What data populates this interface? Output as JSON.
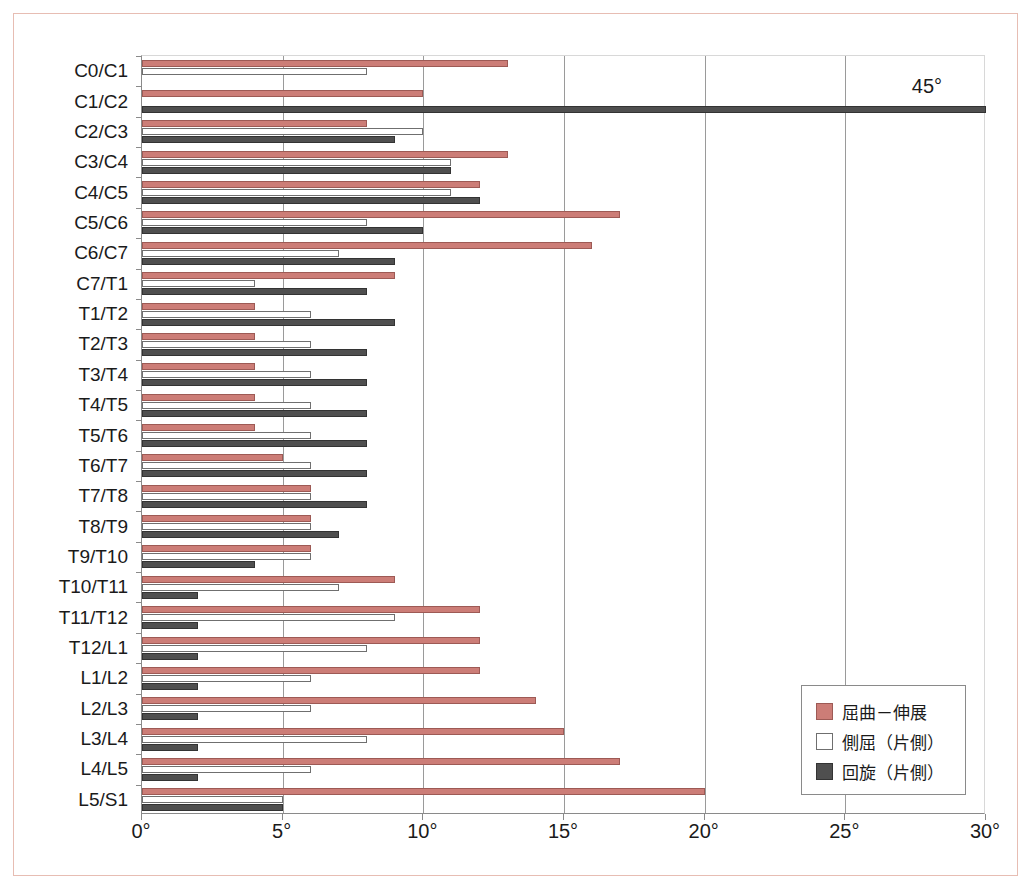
{
  "chart_data": {
    "type": "bar",
    "orientation": "horizontal",
    "title": "",
    "xlabel": "",
    "ylabel": "",
    "xlim": [
      0,
      30
    ],
    "xticks": [
      "0°",
      "5°",
      "10°",
      "15°",
      "20°",
      "25°",
      "30°"
    ],
    "xtick_values": [
      0,
      5,
      10,
      15,
      20,
      25,
      30
    ],
    "grid": true,
    "grid_axis": "x",
    "legend_position": "bottom-right",
    "categories": [
      "C0/C1",
      "C1/C2",
      "C2/C3",
      "C3/C4",
      "C4/C5",
      "C5/C6",
      "C6/C7",
      "C7/T1",
      "T1/T2",
      "T2/T3",
      "T3/T4",
      "T4/T5",
      "T5/T6",
      "T6/T7",
      "T7/T8",
      "T8/T9",
      "T9/T10",
      "T10/T11",
      "T11/T12",
      "T12/L1",
      "L1/L2",
      "L2/L3",
      "L3/L4",
      "L4/L5",
      "L5/S1"
    ],
    "series": [
      {
        "name": "屈曲－伸展",
        "color": "#cc7d77",
        "values": [
          13,
          10,
          8,
          13,
          12,
          17,
          16,
          9,
          4,
          4,
          4,
          4,
          4,
          5,
          6,
          6,
          6,
          9,
          12,
          12,
          12,
          14,
          15,
          17,
          20
        ]
      },
      {
        "name": "側屈（片側）",
        "color": "#ffffff",
        "values": [
          8,
          null,
          10,
          11,
          11,
          8,
          7,
          4,
          6,
          6,
          6,
          6,
          6,
          6,
          6,
          6,
          6,
          7,
          9,
          8,
          6,
          6,
          8,
          6,
          5
        ]
      },
      {
        "name": "回旋（片側）",
        "color": "#4f4f4f",
        "values": [
          null,
          45,
          9,
          11,
          12,
          10,
          9,
          8,
          9,
          8,
          8,
          8,
          8,
          8,
          8,
          7,
          4,
          2,
          2,
          2,
          2,
          2,
          2,
          2,
          5
        ]
      }
    ],
    "annotations": [
      {
        "text": "45°",
        "category": "C1/C2",
        "series": "回旋（片側）",
        "value": 45,
        "note": "bar extends beyond axis maximum"
      }
    ]
  },
  "legend": {
    "items": [
      {
        "label": "屈曲－伸展",
        "swatch": "flex"
      },
      {
        "label": "側屈（片側）",
        "swatch": "lat"
      },
      {
        "label": "回旋（片側）",
        "swatch": "rot"
      }
    ]
  },
  "colors": {
    "flexion": "#cc7d77",
    "lateral": "#ffffff",
    "rotation": "#4f4f4f",
    "frame": "#e7bdb3",
    "axis": "#8a8a8a",
    "grid": "#9a9a9a",
    "text": "#1a1a1a"
  }
}
